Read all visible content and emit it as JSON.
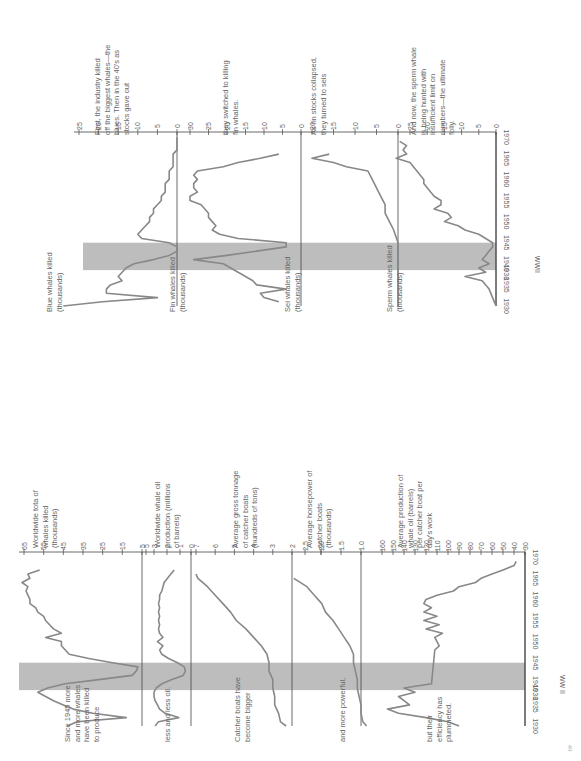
{
  "page_number": "49",
  "chart_data": [
    {
      "type": "line",
      "title": "Whale species killed, 1930-1970",
      "x_label": "WWII",
      "x_ticks": [
        "1930",
        "1935",
        "1938",
        "1940",
        "1945",
        "1950",
        "1955",
        "1960",
        "1965",
        "1970"
      ],
      "x_range": [
        1930,
        1970
      ],
      "highlight": {
        "label": "WWII",
        "from": 1938.5,
        "to": 1945
      },
      "panels": [
        {
          "name": "blue",
          "label": "Blue whales killed (thousands)",
          "annotation": "First, the industry killed off the biggest whales—the blues. Then in the 40's as stocks gave out",
          "ylim": [
            0,
            25
          ],
          "y_ticks": [
            "25",
            "20",
            "15",
            "10",
            "5",
            "0"
          ],
          "x": [
            1930,
            1931,
            1932,
            1933,
            1934,
            1935,
            1936,
            1937,
            1938,
            1939,
            1940,
            1941,
            1942,
            1943,
            1944,
            1945,
            1946,
            1947,
            1948,
            1949,
            1950,
            1951,
            1952,
            1953,
            1954,
            1955,
            1956,
            1957,
            1958,
            1959,
            1960,
            1961,
            1962,
            1963,
            1964,
            1965,
            1966,
            1967,
            1968,
            1969,
            1970
          ],
          "values": [
            29,
            19,
            5,
            18,
            18,
            17,
            14,
            15,
            14,
            13,
            11,
            6,
            2,
            0,
            0,
            2,
            9,
            10,
            9,
            8,
            7,
            7,
            6,
            6,
            5,
            4,
            4,
            3,
            3,
            3,
            2,
            2,
            2,
            1,
            1,
            1,
            1,
            0,
            0,
            0,
            0
          ]
        },
        {
          "name": "fin",
          "label": "Fin whales killed (thousands)",
          "annotation": "they switched to killing fin whales.",
          "ylim": [
            0,
            30
          ],
          "y_ticks": [
            "30",
            "25",
            "20",
            "15",
            "10",
            "5",
            "0"
          ],
          "x": [
            1931,
            1932,
            1933,
            1934,
            1935,
            1936,
            1937,
            1938,
            1939,
            1940,
            1941,
            1942,
            1943,
            1944,
            1945,
            1946,
            1947,
            1948,
            1949,
            1950,
            1951,
            1952,
            1953,
            1954,
            1955,
            1956,
            1957,
            1958,
            1959,
            1960,
            1961,
            1962,
            1963,
            1964,
            1965,
            1966
          ],
          "values": [
            6,
            10,
            11,
            4,
            12,
            13,
            15,
            17,
            19,
            21,
            29,
            20,
            12,
            4,
            4,
            17,
            22,
            24,
            23,
            24,
            25,
            25,
            26,
            27,
            30,
            30,
            28,
            29,
            29,
            28,
            29,
            28,
            21,
            17,
            11,
            6
          ]
        },
        {
          "name": "sei",
          "label": "Sei whales killed (thousands)",
          "annotation": "As fin stocks collapsed, they turned to seis",
          "ylim": [
            0,
            20
          ],
          "y_ticks": [
            "20",
            "15",
            "10",
            "5",
            "0"
          ],
          "x": [
            1930,
            1935,
            1940,
            1945,
            1948,
            1950,
            1952,
            1954,
            1956,
            1958,
            1960,
            1962,
            1963,
            1964,
            1965,
            1966
          ],
          "values": [
            0,
            0,
            0,
            0,
            1,
            2,
            3,
            3,
            4,
            5,
            6,
            7,
            12,
            15,
            20,
            16
          ]
        },
        {
          "name": "sperm",
          "label": "Sperm whales killed (thousands)",
          "annotation": "And now, the sperm whale is being hunted with insufficient limit on numbers—the ultimate folly.",
          "ylim": [
            0,
            25
          ],
          "y_ticks": [
            "25",
            "20",
            "15",
            "10",
            "5",
            "0"
          ],
          "x": [
            1930,
            1932,
            1934,
            1936,
            1937,
            1938,
            1939,
            1940,
            1941,
            1942,
            1943,
            1944,
            1945,
            1946,
            1947,
            1948,
            1949,
            1950,
            1951,
            1952,
            1953,
            1954,
            1955,
            1956,
            1957,
            1958,
            1959,
            1960,
            1961,
            1962,
            1963,
            1964,
            1965,
            1966,
            1967,
            1968,
            1969
          ],
          "values": [
            0,
            1,
            2,
            4,
            9,
            3,
            5,
            2,
            4,
            3,
            2,
            1,
            1,
            3,
            5,
            9,
            11,
            15,
            13,
            14,
            18,
            16,
            16,
            18,
            19,
            20,
            21,
            21,
            22,
            23,
            24,
            25,
            29,
            26,
            27,
            26,
            28
          ]
        }
      ]
    },
    {
      "type": "line",
      "title": "Whaling industry indicators, 1930-1970",
      "x_label": "WW II",
      "x_ticks": [
        "1930",
        "1935",
        "1938",
        "1940",
        "1945",
        "1950",
        "1955",
        "1960",
        "1965",
        "1970"
      ],
      "x_range": [
        1930,
        1970
      ],
      "highlight": {
        "label": "WW II",
        "from": 1938.5,
        "to": 1945
      },
      "panels": [
        {
          "name": "total",
          "label": "Worldwide tota of whales killed (thousands)",
          "annotation": "Since 1945 more and more whales have been killed to produce",
          "ylim": [
            5,
            65
          ],
          "y_ticks": [
            "65",
            "55",
            "45",
            "35",
            "25",
            "15",
            "5"
          ],
          "x": [
            1930,
            1931,
            1932,
            1933,
            1934,
            1935,
            1936,
            1937,
            1938,
            1939,
            1940,
            1941,
            1942,
            1943,
            1944,
            1945,
            1946,
            1947,
            1948,
            1949,
            1950,
            1951,
            1952,
            1953,
            1954,
            1955,
            1956,
            1957,
            1958,
            1959,
            1960,
            1961,
            1962,
            1963,
            1964,
            1965,
            1966,
            1967
          ],
          "values": [
            43,
            38,
            13,
            30,
            40,
            45,
            50,
            54,
            58,
            53,
            44,
            27,
            10,
            8,
            7,
            20,
            32,
            42,
            44,
            46,
            46,
            54,
            46,
            50,
            52,
            54,
            55,
            58,
            59,
            62,
            62,
            63,
            64,
            63,
            66,
            62,
            63,
            57
          ]
        },
        {
          "name": "oil",
          "label": "Worldwide whale oil production (millions of barrels)",
          "annotation": "less and less oil.",
          "ylim": [
            0,
            5
          ],
          "y_ticks": [
            "5",
            "3",
            "2",
            "1",
            "0"
          ],
          "x": [
            1930,
            1931,
            1932,
            1933,
            1934,
            1935,
            1936,
            1937,
            1938,
            1939,
            1940,
            1941,
            1942,
            1943,
            1944,
            1945,
            1946,
            1947,
            1948,
            1949,
            1950,
            1951,
            1952,
            1953,
            1954,
            1955,
            1956,
            1957,
            1958,
            1959,
            1960,
            1961,
            1962,
            1963,
            1964,
            1965,
            1966,
            1967
          ],
          "values": [
            3.2,
            2.9,
            1.1,
            2.3,
            2.8,
            3.0,
            3.2,
            3.3,
            3.3,
            3.1,
            2.6,
            1.7,
            0.7,
            0.5,
            0.6,
            1.2,
            2.0,
            2.6,
            2.8,
            2.5,
            3.0,
            2.5,
            2.8,
            2.9,
            2.8,
            2.9,
            2.8,
            2.9,
            2.8,
            2.9,
            2.8,
            2.8,
            2.6,
            2.5,
            2.4,
            2.1,
            1.8,
            1.5
          ]
        },
        {
          "name": "tonnage",
          "label": "Average gross tonnage of catcher boats (hundreds of tons)",
          "annotation": "Catcher boats have become bigger",
          "ylim": [
            2,
            7
          ],
          "y_ticks": [
            "7",
            "6",
            "5",
            "4",
            "3",
            "2"
          ],
          "x": [
            1930,
            1931,
            1933,
            1935,
            1937,
            1939,
            1941,
            1943,
            1945,
            1947,
            1949,
            1951,
            1953,
            1955,
            1957,
            1959,
            1961,
            1963,
            1965,
            1966
          ],
          "values": [
            2.3,
            2.6,
            2.7,
            2.9,
            2.9,
            3.0,
            3.0,
            3.2,
            3.2,
            3.3,
            3.6,
            4.0,
            4.4,
            4.9,
            5.2,
            5.6,
            6.0,
            6.4,
            6.9,
            7.0
          ]
        },
        {
          "name": "horsepower",
          "label": "Average horsepower of catcher boats (thousands)",
          "annotation": "and more powerful,",
          "ylim": [
            0.8,
            2.8
          ],
          "y_ticks": [
            "2",
            "2.5",
            "2.0",
            "1.5",
            "1.0"
          ],
          "x": [
            1930,
            1931,
            1933,
            1935,
            1937,
            1939,
            1941,
            1943,
            1945,
            1947,
            1949,
            1951,
            1953,
            1955,
            1957,
            1959,
            1961,
            1963,
            1965
          ],
          "values": [
            0.85,
            0.95,
            1.0,
            1.0,
            1.05,
            1.1,
            1.1,
            1.15,
            1.2,
            1.2,
            1.3,
            1.45,
            1.6,
            1.75,
            1.95,
            2.05,
            2.25,
            2.45,
            2.8
          ]
        },
        {
          "name": "efficiency",
          "label": "Average production of whale oil (barrels) per catcher boat per day's work",
          "annotation": "but their efficiency has plummeted.",
          "ylim": [
            30,
            160
          ],
          "y_ticks": [
            "160",
            "150",
            "140",
            "130",
            "120",
            "110",
            "100",
            "90",
            "80",
            "70",
            "60",
            "50",
            "40",
            "30"
          ],
          "x": [
            1930,
            1931,
            1932,
            1933,
            1934,
            1935,
            1936,
            1937,
            1938,
            1939,
            1940,
            1948,
            1949,
            1950,
            1951,
            1952,
            1953,
            1954,
            1955,
            1956,
            1957,
            1958,
            1959,
            1960,
            1961,
            1962,
            1963,
            1964,
            1965,
            1966,
            1967,
            1968,
            1969
          ],
          "values": [
            90,
            100,
            120,
            145,
            155,
            135,
            140,
            145,
            130,
            140,
            115,
            112,
            108,
            110,
            112,
            105,
            120,
            108,
            122,
            110,
            122,
            115,
            122,
            120,
            110,
            95,
            90,
            75,
            70,
            60,
            50,
            40,
            38
          ]
        }
      ]
    }
  ]
}
